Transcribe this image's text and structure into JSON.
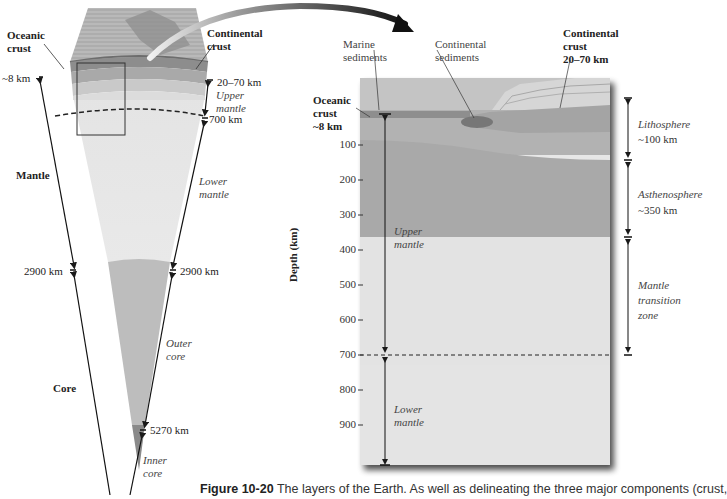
{
  "figure": {
    "caption_label": "Figure 10-20",
    "caption_text": "The layers of the Earth. As well as delineating the three major components (crust,"
  },
  "wedge": {
    "labels": {
      "oceanic_crust": "Oceanic crust",
      "continental_crust": "Continental crust",
      "mantle": "Mantle",
      "core": "Core",
      "upper_mantle": "Upper mantle",
      "lower_mantle": "Lower mantle",
      "outer_core": "Outer core",
      "inner_core": "Inner core"
    },
    "depths": {
      "oceanic_crust": "~8 km",
      "continental_crust": "20–70 km",
      "upper_lower_boundary": "700 km",
      "core_mantle_left": "2900 km",
      "core_mantle_right": "2900 km",
      "inner_outer_boundary": "5270 km"
    }
  },
  "cross_section": {
    "labels": {
      "marine_sediments": "Marine sediments",
      "continental_sediments": "Continental sediments",
      "continental_crust": "Continental crust",
      "continental_crust_depth": "20–70 km",
      "oceanic_crust": "Oceanic crust",
      "oceanic_crust_depth": "~8 km",
      "upper_mantle": "Upper mantle",
      "lower_mantle": "Lower mantle"
    },
    "axis": {
      "ylabel": "Depth (km)",
      "ticks": [
        "100",
        "200",
        "300",
        "400",
        "500",
        "600",
        "700",
        "800",
        "900"
      ]
    },
    "zones": [
      {
        "name": "Lithosphere",
        "value": "~100 km"
      },
      {
        "name": "Asthenosphere",
        "value": "~350 km"
      },
      {
        "name": "Mantle transition zone",
        "value": ""
      }
    ]
  },
  "colors": {
    "crust": "#8f8f8f",
    "lithosphere": "#b4b4b4",
    "asthenosphere": "#a9a9a9",
    "transition_zone": "#e2e2e2",
    "lower_mantle": "#e6e6e6",
    "outer_core": "#bdbdbd",
    "inner_core": "#8a8a8a",
    "arrow": "#1a1a1a"
  }
}
